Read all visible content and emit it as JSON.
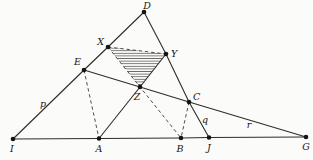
{
  "figure": {
    "width": 313,
    "height": 160,
    "background": "#fbfbfa",
    "line_color": "#2e2d2b",
    "dashed_color": "#3a3937",
    "dot_color": "#151413",
    "label_color": "#151413",
    "hatch_color": "#454440",
    "line_width": 1.1,
    "dash_width": 0.9,
    "dash_pattern": "3.4 2.8",
    "dot_radius": 2.3
  },
  "diagram": {
    "points": {
      "D": [
        144,
        12
      ],
      "X": [
        108,
        47
      ],
      "Y": [
        166,
        54
      ],
      "E": [
        84,
        70
      ],
      "Z": [
        140,
        87
      ],
      "C": [
        189,
        102
      ],
      "I": [
        13,
        139
      ],
      "A": [
        99,
        138.5
      ],
      "B": [
        181,
        138
      ],
      "J": [
        209,
        137.5
      ],
      "G": [
        306,
        137
      ]
    },
    "solid_paths": [
      {
        "name": "left-edge-I-E-X-D",
        "points": [
          "I",
          "E",
          "X",
          "D"
        ]
      },
      {
        "name": "right-edge-D-Y-C-J",
        "points": [
          "D",
          "Y",
          "C",
          "J"
        ]
      },
      {
        "name": "baseline-I-A-B-J-G",
        "points": [
          "I",
          "A",
          "B",
          "J",
          "G"
        ]
      },
      {
        "name": "transversal-E-Z-C-G",
        "points": [
          "E",
          "Z",
          "C",
          "G"
        ]
      },
      {
        "name": "cevian-A-Z-Y",
        "points": [
          "A",
          "Z",
          "Y"
        ]
      }
    ],
    "dashed_paths": [
      {
        "name": "dashed-X-Z-B",
        "points": [
          "X",
          "Z",
          "B"
        ]
      },
      {
        "name": "dashed-E-A",
        "points": [
          "E",
          "A"
        ]
      },
      {
        "name": "dashed-C-B",
        "points": [
          "C",
          "B"
        ]
      },
      {
        "name": "dashed-X-Y",
        "points": [
          "X",
          "Y"
        ]
      }
    ],
    "hatched_triangle": {
      "name": "hatched-triangle-XYZ",
      "points": [
        "X",
        "Y",
        "Z"
      ]
    },
    "point_labels": [
      {
        "text": "D",
        "x": 147,
        "y": 9,
        "anchor": "middle"
      },
      {
        "text": "X",
        "x": 104,
        "y": 45,
        "anchor": "end"
      },
      {
        "text": "Y",
        "x": 171,
        "y": 57,
        "anchor": "start"
      },
      {
        "text": "E",
        "x": 81,
        "y": 65,
        "anchor": "end"
      },
      {
        "text": "Z",
        "x": 137,
        "y": 100,
        "anchor": "middle"
      },
      {
        "text": "C",
        "x": 193,
        "y": 100,
        "anchor": "start"
      },
      {
        "text": "I",
        "x": 12,
        "y": 152,
        "anchor": "middle"
      },
      {
        "text": "A",
        "x": 99,
        "y": 152,
        "anchor": "middle"
      },
      {
        "text": "B",
        "x": 180,
        "y": 152,
        "anchor": "middle"
      },
      {
        "text": "J",
        "x": 209,
        "y": 151,
        "anchor": "middle"
      },
      {
        "text": "G",
        "x": 306,
        "y": 150,
        "anchor": "middle"
      }
    ],
    "line_labels": [
      {
        "text": "p",
        "x": 43,
        "y": 107,
        "anchor": "middle"
      },
      {
        "text": "q",
        "x": 205,
        "y": 123,
        "anchor": "middle"
      },
      {
        "text": "r",
        "x": 249,
        "y": 128,
        "anchor": "middle"
      }
    ]
  }
}
